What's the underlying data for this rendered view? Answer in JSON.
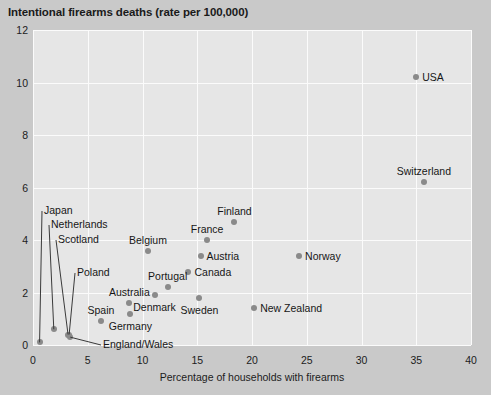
{
  "chart_data": {
    "type": "scatter",
    "title": "Intentional firearms deaths (rate per 100,000)",
    "xlabel": "Percentage of households with firearms",
    "ylabel": "",
    "xlim": [
      0,
      40
    ],
    "ylim": [
      0,
      12
    ],
    "xticks": [
      "0",
      "5",
      "10",
      "15",
      "20",
      "25",
      "30",
      "35",
      "40"
    ],
    "yticks": [
      "0",
      "2",
      "4",
      "6",
      "8",
      "10",
      "12"
    ],
    "grid": true,
    "legend": "none",
    "point_color": "#8a8a8a",
    "plot_background": "#e6e6e6",
    "page_background": "#c9c9c9",
    "gridline_color": "#fbfbfb",
    "points": [
      {
        "name": "USA",
        "x": 35.0,
        "y": 10.2,
        "label_pos": "right"
      },
      {
        "name": "Switzerland",
        "x": 35.7,
        "y": 6.2,
        "label_pos": "above"
      },
      {
        "name": "Finland",
        "x": 18.4,
        "y": 4.7,
        "label_pos": "above"
      },
      {
        "name": "France",
        "x": 15.9,
        "y": 4.0,
        "label_pos": "above"
      },
      {
        "name": "Belgium",
        "x": 10.5,
        "y": 3.6,
        "label_pos": "above"
      },
      {
        "name": "Austria",
        "x": 15.3,
        "y": 3.4,
        "label_pos": "right"
      },
      {
        "name": "Norway",
        "x": 24.3,
        "y": 3.4,
        "label_pos": "right"
      },
      {
        "name": "Canada",
        "x": 14.2,
        "y": 2.8,
        "label_pos": "right"
      },
      {
        "name": "Portugal",
        "x": 12.3,
        "y": 2.2,
        "label_pos": "above"
      },
      {
        "name": "Denmark",
        "x": 11.1,
        "y": 1.9,
        "label_pos": "below"
      },
      {
        "name": "Sweden",
        "x": 15.2,
        "y": 1.8,
        "label_pos": "below"
      },
      {
        "name": "Australia",
        "x": 8.8,
        "y": 1.6,
        "label_pos": "above"
      },
      {
        "name": "New Zealand",
        "x": 20.2,
        "y": 1.4,
        "label_pos": "right"
      },
      {
        "name": "Germany",
        "x": 8.9,
        "y": 1.2,
        "label_pos": "below"
      },
      {
        "name": "Spain",
        "x": 6.2,
        "y": 0.9,
        "label_pos": "above"
      },
      {
        "name": "Japan",
        "x": 0.6,
        "y": 0.1,
        "label_pos": "leader"
      },
      {
        "name": "Netherlands",
        "x": 1.9,
        "y": 0.6,
        "label_pos": "leader"
      },
      {
        "name": "Scotland",
        "x": 3.2,
        "y": 0.4,
        "label_pos": "leader"
      },
      {
        "name": "Poland",
        "x": 3.3,
        "y": 0.4,
        "label_pos": "leader"
      },
      {
        "name": "England/Wales",
        "x": 3.4,
        "y": 0.3,
        "label_pos": "leader"
      }
    ],
    "leader_labels": [
      {
        "name": "Japan",
        "label_x": 44,
        "label_y": 210
      },
      {
        "name": "Netherlands",
        "label_x": 51,
        "label_y": 224
      },
      {
        "name": "Scotland",
        "label_x": 58,
        "label_y": 239
      },
      {
        "name": "Poland",
        "label_x": 77,
        "label_y": 272
      },
      {
        "name": "England/Wales",
        "label_x": 103,
        "label_y": 344
      }
    ]
  }
}
